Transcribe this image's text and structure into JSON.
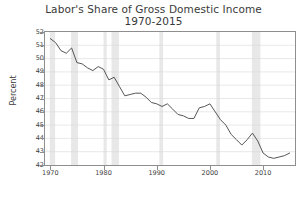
{
  "chart_data": {
    "type": "line",
    "title": "Labor's Share of Gross Domestic Income",
    "subtitle": "1970-2015",
    "xlabel": "",
    "ylabel": "Percent",
    "xlim": [
      1969,
      2016
    ],
    "ylim": [
      42,
      52
    ],
    "grid": true,
    "grid_axis": "y",
    "legend": "none",
    "ytick_labels": [
      "52",
      "51",
      "50",
      "49",
      "48",
      "47",
      "46",
      "45",
      "44",
      "43",
      "42"
    ],
    "ytick_values": [
      52,
      51,
      50,
      49,
      48,
      47,
      46,
      45,
      44,
      43,
      42
    ],
    "xtick_labels": [
      "1970",
      "1980",
      "1990",
      "2000",
      "2010"
    ],
    "xtick_values": [
      1970,
      1980,
      1990,
      2000,
      2010
    ],
    "line_color": "#555555",
    "series": [
      {
        "name": "Labor's Share of Gross Domestic Income",
        "x": [
          1970,
          1971,
          1972,
          1973,
          1974,
          1975,
          1976,
          1977,
          1978,
          1979,
          1980,
          1981,
          1982,
          1983,
          1984,
          1985,
          1986,
          1987,
          1988,
          1989,
          1990,
          1991,
          1992,
          1993,
          1994,
          1995,
          1996,
          1997,
          1998,
          1999,
          2000,
          2001,
          2002,
          2003,
          2004,
          2005,
          2006,
          2007,
          2008,
          2009,
          2010,
          2011,
          2012,
          2013,
          2014,
          2015
        ],
        "values": [
          51.5,
          51.2,
          50.6,
          50.4,
          50.8,
          49.7,
          49.6,
          49.3,
          49.1,
          49.4,
          49.2,
          48.4,
          48.6,
          47.9,
          47.2,
          47.3,
          47.4,
          47.4,
          47.1,
          46.7,
          46.6,
          46.4,
          46.6,
          46.2,
          45.8,
          45.7,
          45.5,
          45.5,
          46.3,
          46.4,
          46.6,
          46.0,
          45.4,
          45.0,
          44.3,
          43.9,
          43.5,
          43.9,
          44.4,
          43.8,
          42.9,
          42.6,
          42.5,
          42.6,
          42.7,
          42.9
        ]
      }
    ],
    "shaded_bands": [
      {
        "label": "recession",
        "start": 1969.9,
        "end": 1970.9
      },
      {
        "label": "recession",
        "start": 1973.9,
        "end": 1975.2
      },
      {
        "label": "recession",
        "start": 1980.0,
        "end": 1980.6
      },
      {
        "label": "recession",
        "start": 1981.5,
        "end": 1982.9
      },
      {
        "label": "recession",
        "start": 1990.5,
        "end": 1991.2
      },
      {
        "label": "recession",
        "start": 2001.2,
        "end": 2001.9
      },
      {
        "label": "recession",
        "start": 2007.9,
        "end": 2009.5
      }
    ],
    "band_color": "#e8e8e8"
  }
}
